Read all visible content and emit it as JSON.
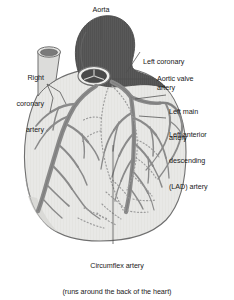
{
  "figure": {
    "colors": {
      "background": "#ffffff",
      "heart_body": "#e8e8e6",
      "heart_outline": "#6f6f6f",
      "artery": "#8a8a8a",
      "artery_outline": "#5f5f5f",
      "aorta_dark": "#595959",
      "vessel_stump": "#dcdcda",
      "valve_dark": "#4a4a4a",
      "hidden_vessel_dotted": "#9a9a9a",
      "leader_line": "#4d4d4d",
      "label_text": "#1a1a1a"
    },
    "labels": [
      {
        "id": "aorta",
        "text": "Aorta"
      },
      {
        "id": "right-coronary",
        "line1": "Right",
        "line2": "coronary",
        "line3": "artery"
      },
      {
        "id": "left-coronary",
        "line1": "Left coronary",
        "line2": "artery"
      },
      {
        "id": "aortic-valve",
        "text": "Aortic valve"
      },
      {
        "id": "left-main",
        "line1": "Left main",
        "line2": "artery"
      },
      {
        "id": "lad",
        "line1": "Left anterior",
        "line2": "descending",
        "line3": "(LAD) artery"
      },
      {
        "id": "circumflex",
        "line1": "Circumflex artery",
        "line2": "(runs around the back of the heart)"
      }
    ]
  }
}
